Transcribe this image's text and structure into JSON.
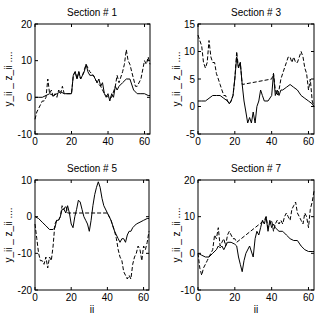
{
  "chart_data": [
    {
      "type": "line",
      "title": "Section # 1",
      "xlabel": "",
      "ylabel": "y_ii _ z_ii ....",
      "xlim": [
        0,
        63
      ],
      "ylim": [
        -10,
        20
      ],
      "xticks": [
        0,
        20,
        40,
        60
      ],
      "yticks": [
        -10,
        0,
        10,
        20
      ],
      "grid": false,
      "box": {
        "x0": 35,
        "x1": 150,
        "y0": 24,
        "y1": 134
      },
      "series": [
        {
          "name": "y_ii",
          "style": "solid",
          "x": [
            0,
            2,
            4,
            6,
            8,
            10,
            12,
            14,
            16,
            18,
            20,
            21,
            22,
            23,
            24,
            25,
            26,
            27,
            28,
            29,
            30,
            32,
            34,
            35,
            36,
            37,
            38,
            39,
            40,
            41,
            42,
            43,
            44,
            45,
            46,
            48,
            50,
            52,
            54,
            56,
            58,
            60,
            62,
            63
          ],
          "values": [
            0,
            0,
            0,
            0.5,
            1,
            0.5,
            1,
            1.5,
            1,
            1,
            1,
            6,
            7,
            5,
            7,
            5,
            6,
            7,
            9,
            7,
            6,
            6,
            4,
            5,
            3,
            4,
            1,
            0,
            1,
            -1,
            1,
            0,
            3,
            2,
            3,
            4,
            5,
            5,
            2,
            1,
            1,
            1,
            0.5,
            0.5
          ]
        },
        {
          "name": "z_ii",
          "style": "dashed",
          "x": [
            0,
            1,
            2,
            3,
            4,
            5,
            6,
            7,
            8,
            9,
            10,
            11,
            12,
            13,
            14,
            15,
            16,
            18,
            20,
            21,
            22,
            23,
            24,
            25,
            26,
            28,
            30,
            32,
            34,
            36,
            38,
            40,
            42,
            44,
            45,
            46,
            48,
            49,
            50,
            51,
            52,
            53,
            54,
            55,
            56,
            58,
            60,
            61,
            62,
            63
          ],
          "values": [
            -6,
            -4,
            -3,
            -2,
            -1,
            -1,
            0,
            5,
            1,
            2,
            0,
            1,
            0,
            2,
            1,
            3,
            1,
            1,
            1,
            6,
            7,
            5,
            7,
            5,
            6,
            9,
            7,
            6,
            4,
            3,
            1,
            0,
            0,
            3,
            6,
            4,
            7,
            9,
            13,
            10,
            9,
            7,
            5,
            3,
            3,
            5,
            10,
            9,
            11,
            9
          ]
        }
      ]
    },
    {
      "type": "line",
      "title": "Section # 3",
      "xlabel": "",
      "ylabel": "y_ii _ z_ii ....",
      "xlim": [
        0,
        63
      ],
      "ylim": [
        -5,
        15
      ],
      "xticks": [
        0,
        20,
        40,
        60
      ],
      "yticks": [
        -5,
        0,
        5,
        10,
        15
      ],
      "grid": false,
      "box": {
        "x0": 198,
        "x1": 314,
        "y0": 24,
        "y1": 134
      },
      "series": [
        {
          "name": "y_ii",
          "style": "solid",
          "x": [
            0,
            2,
            4,
            6,
            8,
            10,
            12,
            14,
            16,
            17,
            18,
            19,
            20,
            21,
            22,
            23,
            24,
            25,
            26,
            27,
            28,
            29,
            30,
            31,
            32,
            33,
            34,
            35,
            36,
            38,
            40,
            41,
            42,
            43,
            44,
            45,
            46,
            48,
            50,
            52,
            54,
            56,
            58,
            60,
            62,
            63
          ],
          "values": [
            1,
            1,
            1,
            1.5,
            2,
            2,
            2,
            1.5,
            1,
            0.5,
            1,
            2,
            5,
            9,
            7,
            8,
            4,
            1,
            -1,
            -3,
            -2,
            -3,
            -1,
            -3,
            0,
            1,
            3,
            2,
            1,
            1,
            2,
            6,
            2,
            3,
            2,
            3,
            3,
            3.5,
            4,
            3.5,
            3,
            2,
            1.5,
            1,
            0.5,
            0
          ]
        },
        {
          "name": "z_ii",
          "style": "dashed",
          "x": [
            0,
            1,
            2,
            3,
            4,
            5,
            6,
            7,
            8,
            9,
            10,
            11,
            12,
            13,
            14,
            15,
            16,
            17,
            18,
            19,
            20,
            21,
            22,
            23,
            24,
            40,
            41,
            42,
            43,
            44,
            45,
            46,
            47,
            48,
            49,
            50,
            51,
            52,
            53,
            54,
            55,
            56,
            57,
            58,
            59,
            60,
            61,
            62,
            63
          ],
          "values": [
            13,
            12,
            11,
            8,
            7,
            8,
            12,
            9,
            8,
            8,
            6,
            5,
            4,
            3,
            2,
            2,
            1,
            0.5,
            1,
            2,
            5,
            10,
            7,
            8,
            4,
            5,
            6,
            3,
            2,
            3,
            5,
            6,
            7,
            8,
            9,
            9,
            8,
            9,
            8,
            8,
            9,
            10,
            9,
            7,
            6,
            3,
            5,
            1,
            0
          ]
        }
      ]
    },
    {
      "type": "line",
      "title": "Section # 5",
      "xlabel": "ii",
      "ylabel": "y_ii _ z_ii ....",
      "xlim": [
        0,
        63
      ],
      "ylim": [
        -20,
        10
      ],
      "xticks": [
        0,
        20,
        40,
        60
      ],
      "yticks": [
        -20,
        -10,
        0,
        10
      ],
      "grid": false,
      "box": {
        "x0": 35,
        "x1": 149,
        "y0": 180,
        "y1": 290
      },
      "series": [
        {
          "name": "y_ii",
          "style": "solid",
          "x": [
            0,
            2,
            4,
            6,
            8,
            10,
            11,
            12,
            13,
            14,
            15,
            16,
            17,
            18,
            19,
            20,
            21,
            22,
            23,
            24,
            25,
            26,
            27,
            28,
            29,
            30,
            31,
            32,
            33,
            34,
            35,
            36,
            37,
            38,
            40,
            42,
            44,
            45,
            46,
            47,
            48,
            49,
            50,
            51,
            52,
            53,
            54,
            56,
            58,
            60,
            62,
            63
          ],
          "values": [
            0,
            -0.5,
            -1.5,
            -2.5,
            -3.5,
            -3.5,
            -3,
            -1,
            -1,
            0,
            2,
            2,
            1,
            3,
            1,
            -2,
            -3,
            0,
            2,
            4.5,
            4,
            2,
            0,
            -1,
            -2,
            -4,
            -1,
            3,
            6,
            8,
            9.5,
            8,
            5,
            3,
            1,
            -1,
            -4,
            -5,
            -6,
            -7,
            -6,
            -6,
            -7,
            -5,
            -4,
            -4,
            -3,
            -2,
            -1.5,
            -1,
            -0.5,
            -0.5
          ]
        },
        {
          "name": "z_ii",
          "style": "dashed",
          "x": [
            0,
            1,
            2,
            3,
            4,
            5,
            6,
            7,
            8,
            9,
            10,
            11,
            12,
            13,
            14,
            15,
            16,
            17,
            18,
            40,
            42,
            44,
            45,
            46,
            47,
            48,
            49,
            50,
            51,
            52,
            53,
            54,
            55,
            56,
            57,
            58,
            59,
            60,
            61,
            62,
            63
          ],
          "values": [
            -2,
            -6,
            -10,
            -12,
            -12,
            -13,
            -11,
            -14,
            -11,
            -12,
            -8,
            -2,
            -1,
            -1,
            0,
            3,
            2,
            3,
            1,
            1,
            -1,
            -4,
            -6,
            -9,
            -11,
            -12,
            -15,
            -16,
            -17,
            -16,
            -17,
            -13,
            -11,
            -10,
            -8,
            -9,
            -12,
            -8,
            -9,
            -7,
            -4
          ]
        }
      ]
    },
    {
      "type": "line",
      "title": "Section # 7",
      "xlabel": "ii",
      "ylabel": "y_ii _ z_ii ....",
      "xlim": [
        0,
        63
      ],
      "ylim": [
        -10,
        20
      ],
      "xticks": [
        0,
        20,
        40,
        60
      ],
      "yticks": [
        -10,
        0,
        10,
        20
      ],
      "grid": false,
      "box": {
        "x0": 198,
        "x1": 314,
        "y0": 180,
        "y1": 290
      },
      "series": [
        {
          "name": "y_ii",
          "style": "solid",
          "x": [
            0,
            2,
            4,
            6,
            8,
            10,
            11,
            12,
            13,
            14,
            16,
            18,
            20,
            21,
            22,
            23,
            24,
            25,
            26,
            28,
            30,
            31,
            32,
            33,
            34,
            35,
            36,
            37,
            38,
            39,
            40,
            41,
            42,
            44,
            46,
            48,
            50,
            52,
            54,
            56,
            58,
            60,
            62,
            63
          ],
          "values": [
            0,
            -0.5,
            -1,
            -1,
            0,
            1,
            2,
            1.5,
            2,
            1,
            3,
            3,
            2.5,
            2,
            -1,
            -3,
            -5,
            -2,
            0,
            2,
            -1,
            4,
            6,
            5,
            7,
            9,
            8,
            10,
            6,
            9,
            7,
            8,
            7,
            6,
            6,
            5,
            4,
            3.5,
            3.5,
            2,
            1,
            0.5,
            0.5,
            0.5
          ]
        },
        {
          "name": "z_ii",
          "style": "dashed",
          "x": [
            0,
            1,
            2,
            3,
            4,
            5,
            6,
            7,
            8,
            9,
            10,
            11,
            12,
            13,
            14,
            15,
            16,
            17,
            18,
            19,
            20,
            21,
            36,
            37,
            38,
            39,
            40,
            41,
            42,
            43,
            44,
            45,
            46,
            47,
            48,
            49,
            50,
            51,
            52,
            53,
            54,
            55,
            56,
            57,
            58,
            59,
            60,
            61,
            62,
            63
          ],
          "values": [
            0,
            -4,
            -6,
            -4,
            -3,
            -2,
            -1,
            0,
            1,
            5,
            4,
            7,
            2,
            3,
            4,
            2,
            5,
            6,
            5,
            4,
            4,
            3,
            9,
            10,
            7,
            8,
            9,
            6,
            8,
            9,
            8,
            9,
            8,
            10,
            11,
            10,
            9,
            12,
            13,
            14,
            11,
            10,
            9,
            8,
            11,
            10,
            7,
            12,
            14,
            17
          ]
        }
      ]
    }
  ]
}
